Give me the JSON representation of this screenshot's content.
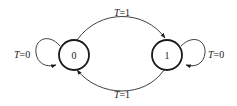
{
  "diagram": {
    "type": "state-transition",
    "states": [
      {
        "id": "s0",
        "label": "0"
      },
      {
        "id": "s1",
        "label": "1"
      }
    ],
    "transitions": [
      {
        "from": "s0",
        "to": "s1",
        "label_var": "T",
        "label_val": "=1"
      },
      {
        "from": "s1",
        "to": "s0",
        "label_var": "T",
        "label_val": "=1"
      },
      {
        "from": "s0",
        "to": "s0",
        "label_var": "T",
        "label_val": "=0"
      },
      {
        "from": "s1",
        "to": "s1",
        "label_var": "T",
        "label_val": "=0"
      }
    ],
    "colors": {
      "stroke": "#1a1a1a",
      "text": "#222222",
      "background": "#ffffff"
    }
  }
}
